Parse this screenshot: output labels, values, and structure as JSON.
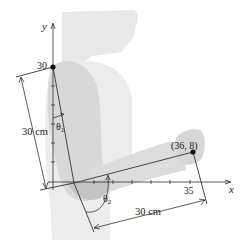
{
  "figure": {
    "axes": {
      "x_label": "x",
      "y_label": "y",
      "y_tick_label": "30",
      "x_tick_label": "35"
    },
    "points": {
      "shoulder_label": "30",
      "hand_label": "(36, 8)"
    },
    "angles": {
      "theta1": "θ",
      "theta1_sub": "1",
      "theta2": "θ",
      "theta2_sub": "2"
    },
    "dimensions": {
      "upper_arm": "30 cm",
      "forearm": "30 cm"
    },
    "colors": {
      "body_fill": "#e6e6e6",
      "body_shade": "#cfcfcf",
      "line": "#333333",
      "point": "#111111"
    }
  }
}
